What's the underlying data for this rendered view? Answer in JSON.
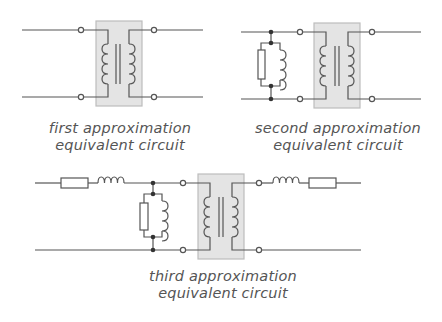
{
  "colors": {
    "wire": "#555555",
    "box_fill": "#e4e4e4",
    "box_stroke": "#bdbdbd",
    "terminal_fill": "#ffffff",
    "junction_fill": "#333333",
    "caption": "#555555"
  },
  "diagrams": [
    {
      "id": "first",
      "caption": {
        "line1": "first approximation",
        "line2": "equivalent circuit"
      },
      "components": [
        "ideal-transformer"
      ]
    },
    {
      "id": "second",
      "caption": {
        "line1": "second approximation",
        "line2": "equivalent circuit"
      },
      "components": [
        "shunt-resistor",
        "shunt-inductor",
        "ideal-transformer"
      ]
    },
    {
      "id": "third",
      "caption": {
        "line1": "third approximation",
        "line2": "equivalent circuit"
      },
      "components": [
        "series-resistor-primary",
        "series-inductor-primary",
        "shunt-resistor",
        "shunt-inductor",
        "ideal-transformer",
        "series-inductor-secondary",
        "series-resistor-secondary"
      ]
    }
  ]
}
